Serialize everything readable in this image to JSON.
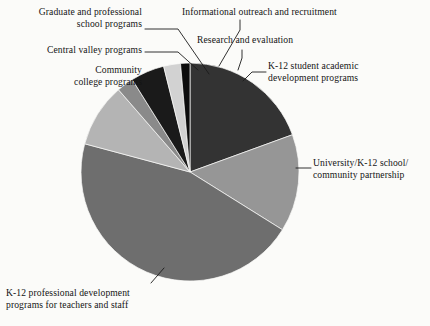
{
  "figure": {
    "background_color": "#fbfbf9",
    "text_color": "#141414"
  },
  "chart_data": {
    "type": "pie",
    "title": "",
    "subtitle": "",
    "xlabel": "",
    "ylabel": "",
    "legend_position": "callout-labels",
    "grid": false,
    "start_angle_deg": 0,
    "direction": "clockwise",
    "center": {
      "x": 190,
      "y": 172
    },
    "radius": 109,
    "categories": [
      "K-12 student academic development programs",
      "University/K-12 school/ community partnership",
      "K-12 professional development programs for teachers and staff",
      "Community college programs",
      "Central valley programs",
      "Graduate and professional school programs",
      "Informational outreach and recruitment",
      "Research and evaluation"
    ],
    "values": [
      19.4,
      14.4,
      45.3,
      9.4,
      2.5,
      5.0,
      2.5,
      1.5
    ],
    "angles_deg": [
      70,
      52,
      163,
      34,
      9,
      18,
      9,
      5
    ],
    "colors": [
      "#333333",
      "#969696",
      "#6e6e6e",
      "#b4b4b4",
      "#8a8a8a",
      "#1a1a1a",
      "#d2d2d2",
      "#0d0d0d"
    ],
    "slices": [
      {
        "label": "K-12 student academic development programs",
        "value": 19.4,
        "angle_deg": 70,
        "color": "#333333"
      },
      {
        "label": "University/K-12 school/ community partnership",
        "value": 14.4,
        "angle_deg": 52,
        "color": "#969696"
      },
      {
        "label": "K-12 professional development programs for teachers and staff",
        "value": 45.3,
        "angle_deg": 163,
        "color": "#6e6e6e"
      },
      {
        "label": "Community college programs",
        "value": 9.4,
        "angle_deg": 34,
        "color": "#b4b4b4"
      },
      {
        "label": "Central valley programs",
        "value": 2.5,
        "angle_deg": 9,
        "color": "#8a8a8a"
      },
      {
        "label": "Graduate and professional school programs",
        "value": 5.0,
        "angle_deg": 18,
        "color": "#1a1a1a"
      },
      {
        "label": "Informational outreach and recruitment",
        "value": 2.5,
        "angle_deg": 9,
        "color": "#d2d2d2"
      },
      {
        "label": "Research and evaluation",
        "value": 1.5,
        "angle_deg": 5,
        "color": "#0d0d0d"
      }
    ]
  },
  "labels": {
    "graduate_professional": "Graduate and professional\nschool programs",
    "informational_outreach": "Informational outreach and recruitment",
    "central_valley": "Central valley programs",
    "research_evaluation": "Research and evaluation",
    "community_college": "Community\ncollege programs",
    "k12_student_academic": "K-12 student academic\ndevelopment programs",
    "university_k12": "University/K-12 school/\ncommunity partnership",
    "k12_professional": "K-12 professional development\nprograms for teachers and staff"
  }
}
